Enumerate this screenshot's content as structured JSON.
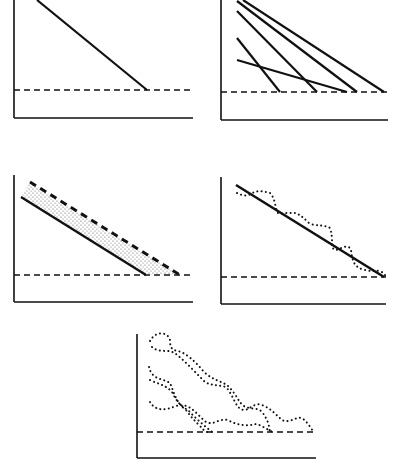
{
  "figure": {
    "colors": {
      "ink": "#111111",
      "background": "#ffffff",
      "stipple": "#555555"
    },
    "panels": [
      {
        "id": "panel-1",
        "type": "single-straight-line",
        "axes": {
          "x0": 14,
          "y_top": 0,
          "y_axis_bottom": 118,
          "x_end": 193
        },
        "baseline_y": 90,
        "lines": [
          {
            "x1": 37,
            "y1": 0,
            "x2": 147,
            "y2": 90
          }
        ]
      },
      {
        "id": "panel-2",
        "type": "multiple-straight-lines",
        "axes": {
          "x0": 221,
          "y_top": 0,
          "y_axis_bottom": 120,
          "x_end": 388
        },
        "baseline_y": 92,
        "lines": [
          {
            "x1": 243,
            "y1": 0,
            "x2": 384,
            "y2": 92
          },
          {
            "x1": 237,
            "y1": 1,
            "x2": 357,
            "y2": 92
          },
          {
            "x1": 237,
            "y1": 11,
            "x2": 317,
            "y2": 92
          },
          {
            "x1": 237,
            "y1": 38,
            "x2": 280,
            "y2": 92
          },
          {
            "x1": 237,
            "y1": 60,
            "x2": 347,
            "y2": 92
          }
        ]
      },
      {
        "id": "panel-3",
        "type": "band-with-stipple",
        "axes": {
          "x0": 14,
          "y_top": 175,
          "y_axis_bottom": 302,
          "x_end": 193
        },
        "baseline_y": 275,
        "lower_line": {
          "x1": 21,
          "y1": 197,
          "x2": 146,
          "y2": 275
        },
        "upper_dashed_line": {
          "x1": 30,
          "y1": 182,
          "x2": 180,
          "y2": 275
        }
      },
      {
        "id": "panel-4",
        "type": "straight-line-with-wavy-dotted",
        "axes": {
          "x0": 221,
          "y_top": 177,
          "y_axis_bottom": 304,
          "x_end": 386
        },
        "baseline_y": 277,
        "line": {
          "x1": 236,
          "y1": 185,
          "x2": 384,
          "y2": 277
        },
        "dotted_path": "M237,193 C243,196 247,196 251,194 C256,190 262,191 270,193 C276,199 275,210 278,213 C284,215 285,212 290,213 C296,212 300,214 310,224 C318,226 326,225 330,228 C334,240 330,248 335,250 C340,250 346,243 351,249 C352,262 355,268 365,270 C373,272 375,270 380,271 C384,273 385,275 386,277"
      },
      {
        "id": "panel-5",
        "type": "multiple-wavy-dotted-lines",
        "axes": {
          "x0": 137,
          "y_top": 334,
          "y_axis_bottom": 458,
          "x_end": 316
        },
        "baseline_y": 432,
        "dotted_paths": [
          "M150,341 C156,330 168,332 170,340 C170,348 172,350 178,351 C186,353 196,362 204,372 C214,381 222,381 228,386 C238,396 238,402 244,406 C250,410 258,407 262,412 C272,425 268,432 271,432",
          "M152,347 C160,354 168,348 176,354 C186,362 195,372 204,381 C210,386 214,384 226,387 C234,396 236,410 244,410 C250,410 254,402 262,405 C272,409 276,415 282,420 C290,424 296,416 302,418 C310,424 312,432 315,432",
          "M149,367 C152,380 162,378 170,383 C174,392 176,403 186,410 C192,418 194,420 198,424 C202,428 205,432 207,432",
          "M150,380 C158,384 166,385 172,392 C176,400 180,406 188,410 C196,419 206,427 212,432",
          "M150,402 C156,412 166,410 176,406 C190,402 196,414 206,422 C214,426 218,418 228,420 C238,426 248,426 256,424 C264,426 270,432 274,432"
        ]
      }
    ]
  }
}
